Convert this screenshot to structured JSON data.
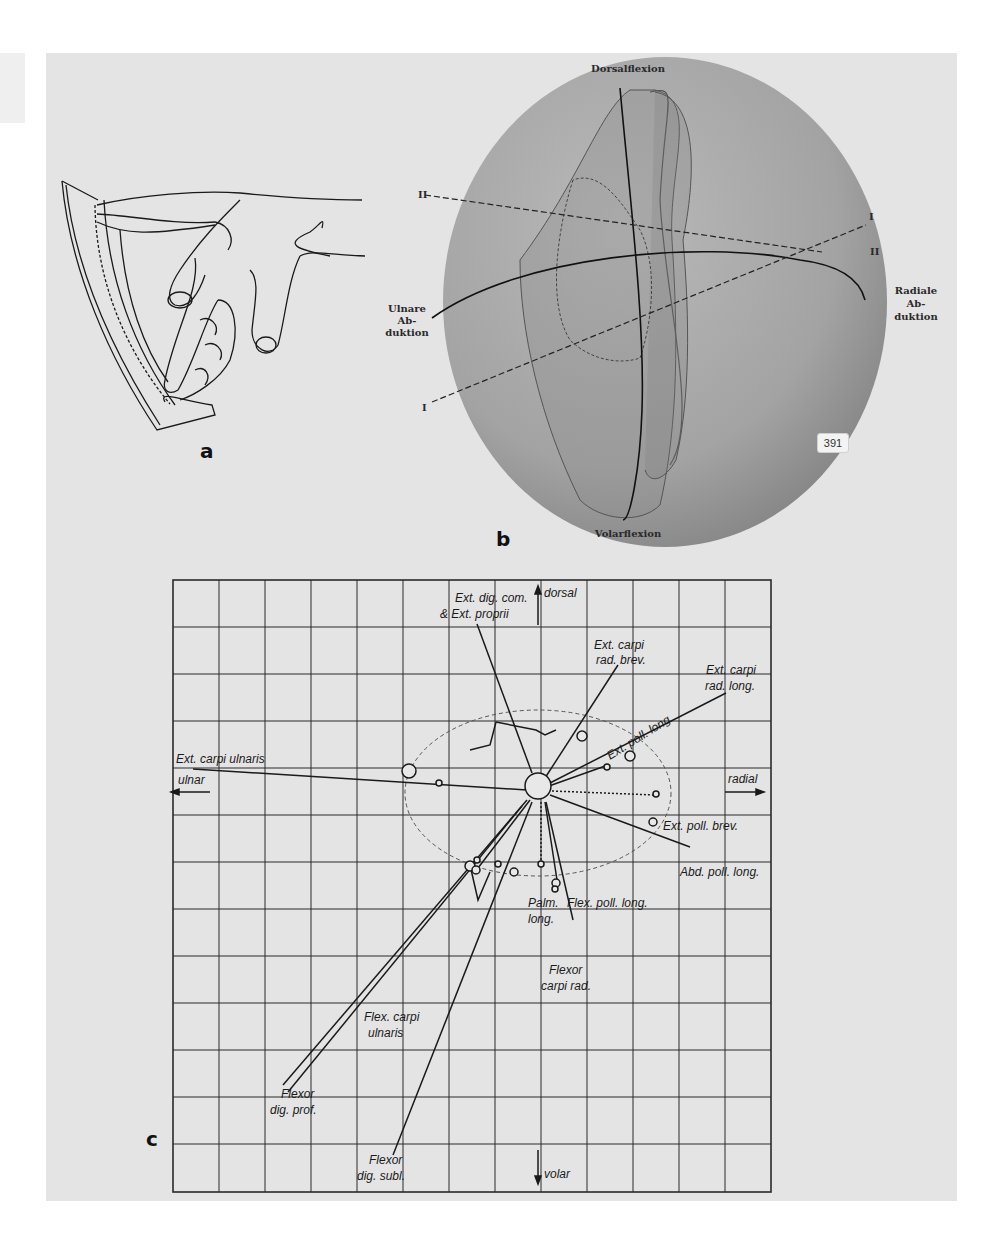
{
  "figure": {
    "panels": {
      "a": {
        "letter": "a"
      },
      "b": {
        "letter": "b",
        "labels": {
          "top": "Dorsalflexion",
          "bottom": "Volarflexion",
          "left": [
            "Ulnare",
            "Ab-",
            "duktion"
          ],
          "right": [
            "Radiale",
            "Ab-",
            "duktion"
          ],
          "axis_I_left": "I",
          "axis_I_right": "I",
          "axis_II_left": "II",
          "axis_II_right": "II"
        },
        "page_badge": "391"
      },
      "c": {
        "letter": "c",
        "directions": {
          "up": "dorsal",
          "down": "volar",
          "left": "ulnar",
          "right": "radial"
        },
        "muscles": [
          {
            "name": "ext_dig_com",
            "lines": [
              "Ext. dig. com.",
              "& Ext. proprii"
            ]
          },
          {
            "name": "ext_carpi_rad_brev",
            "lines": [
              "Ext. carpi",
              "rad. brev."
            ]
          },
          {
            "name": "ext_carpi_rad_long",
            "lines": [
              "Ext. carpi",
              "rad. long."
            ]
          },
          {
            "name": "ext_poll_long",
            "lines": [
              "Ext. poll. long."
            ]
          },
          {
            "name": "ext_carpi_ulnaris",
            "lines": [
              "Ext. carpi ulnaris"
            ]
          },
          {
            "name": "ext_poll_brev",
            "lines": [
              "Ext. poll. brev."
            ]
          },
          {
            "name": "abd_poll_long",
            "lines": [
              "Abd. poll. long."
            ]
          },
          {
            "name": "palm_long",
            "lines": [
              "Palm.",
              "long."
            ]
          },
          {
            "name": "flex_poll_long",
            "lines": [
              "Flex. poll. long."
            ]
          },
          {
            "name": "flexor_carpi_rad",
            "lines": [
              "Flexor",
              "carpi rad."
            ]
          },
          {
            "name": "flex_carpi_ulnaris",
            "lines": [
              "Flex. carpi",
              "ulnaris"
            ]
          },
          {
            "name": "flexor_dig_prof",
            "lines": [
              "Flexor",
              "dig. prof."
            ]
          },
          {
            "name": "flexor_dig_subl",
            "lines": [
              "Flexor",
              "dig. subl."
            ]
          }
        ],
        "grid": {
          "columns": 13,
          "rows": 13
        }
      }
    }
  }
}
